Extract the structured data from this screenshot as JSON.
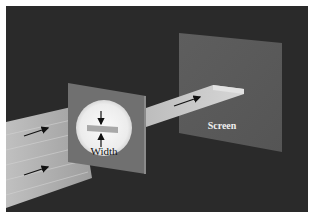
{
  "diagram": {
    "type": "single-slit-diffraction-setup",
    "labels": {
      "slit_width": "Width",
      "screen": "Screen"
    },
    "arrows": {
      "incoming_beam": 2,
      "outgoing_beam": 1,
      "width_indicators": 2
    },
    "colors": {
      "background": "#2a2a2a",
      "frame": "#ffffff",
      "screen_panel": "#5c5c5c",
      "slit_plate": "#707070",
      "beam": "#b9b9b9",
      "aperture": "#f2f2f2",
      "slit_bar": "#a8a8a8",
      "arrow": "#111111",
      "label_light": "#eeeeee",
      "label_dark": "#111111"
    }
  }
}
